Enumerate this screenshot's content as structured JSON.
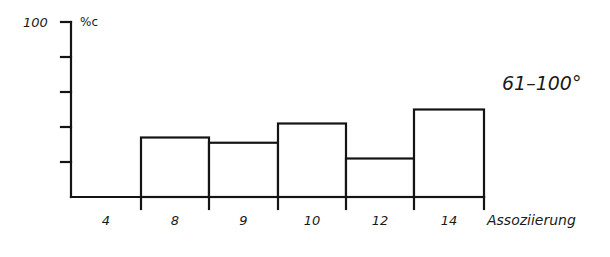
{
  "chart_data": {
    "type": "bar",
    "title": "",
    "annotation": "61–100°",
    "xlabel": "Assoziierung",
    "ylabel": "%c",
    "categories": [
      "4",
      "8",
      "9",
      "10",
      "12",
      "14"
    ],
    "values": [
      0,
      34,
      31,
      42,
      22,
      50
    ],
    "ylim": [
      0,
      100
    ],
    "yticks": [
      0,
      20,
      40,
      60,
      80,
      100
    ],
    "ytick_labels_shown": [
      "100"
    ],
    "grid": false,
    "legend": null,
    "style": {
      "ink_color": "#141414",
      "bar_fill": "#ffffff"
    }
  },
  "labels": {
    "y_top": "100",
    "y_unit": "%c",
    "x_axis": "Assoziierung",
    "annotation": "61–100°"
  }
}
